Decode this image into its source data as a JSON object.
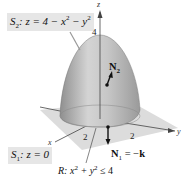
{
  "figure": {
    "surface_top": {
      "name": "S2",
      "equation": "z = 4 − x² − y²",
      "label_name": "S",
      "label_sub": "2",
      "label_rest_1": ": z = 4 − x",
      "label_rest_2": " − y",
      "exp": "2"
    },
    "surface_bottom": {
      "label_name": "S",
      "label_sub": "1",
      "label_rest": ": z = 0"
    },
    "region": {
      "label_prefix": "R: x",
      "label_mid": " + y",
      "label_suffix": " ≤ 4",
      "exp": "2"
    },
    "normals": {
      "n1": {
        "label_bold": "N",
        "sub": "1",
        "rest": " = −",
        "k": "k"
      },
      "n2": {
        "label_bold": "N",
        "sub": "2"
      }
    },
    "axes": {
      "x": "x",
      "y": "y",
      "z": "z"
    },
    "ticks": {
      "z_top": "4",
      "x_tick": "2",
      "y_tick": "2"
    },
    "colors": {
      "surface": "#b9b9b9",
      "plane": "#d8d8d8",
      "label_box": "#e6e6e6",
      "axis": "#333333"
    }
  }
}
